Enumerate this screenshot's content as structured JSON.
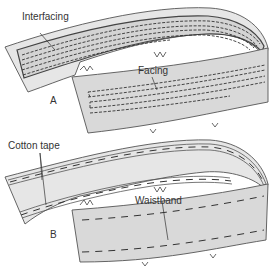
{
  "figure": {
    "panel_a": {
      "letter": "A",
      "labels": {
        "interfacing": "Interfacing",
        "facing": "Facing"
      }
    },
    "panel_b": {
      "letter": "B",
      "labels": {
        "cotton_tape": "Cotton tape",
        "waistband": "Waistband"
      }
    }
  },
  "colors": {
    "fabric": "#d9d9d9",
    "outline": "#555555",
    "stitching": "#333333",
    "background": "#ffffff"
  }
}
